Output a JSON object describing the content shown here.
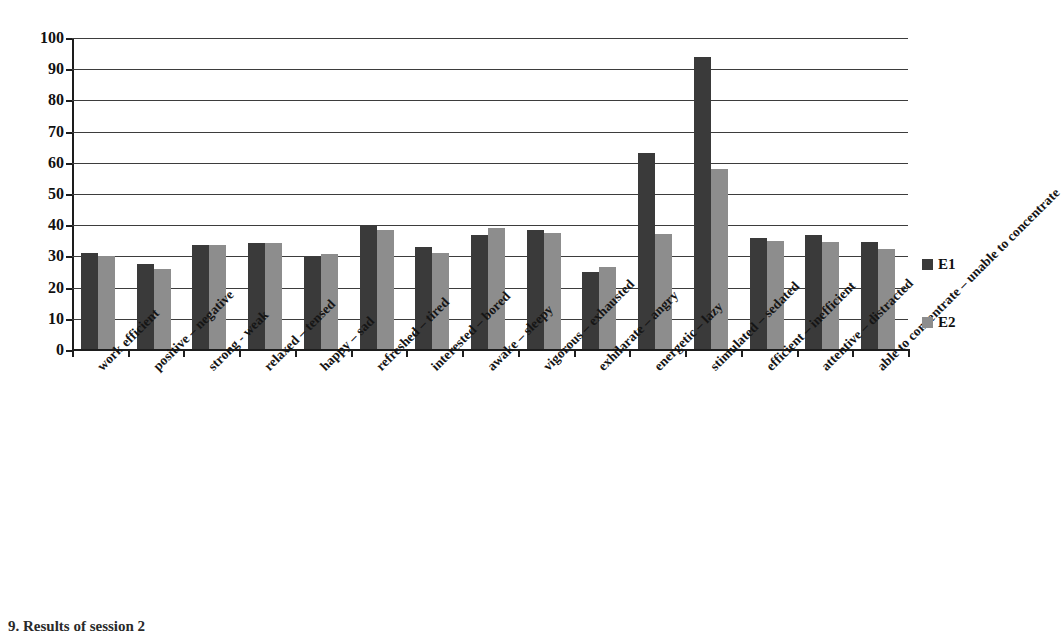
{
  "chart_data": {
    "type": "bar",
    "title": "",
    "subtitle": "",
    "xlabel": "",
    "ylabel": "",
    "ylim": [
      0,
      100
    ],
    "ytick_step": 10,
    "yticks": [
      0,
      10,
      20,
      30,
      40,
      50,
      60,
      70,
      80,
      90,
      100
    ],
    "ytick_labels": [
      "0",
      "10",
      "20",
      "30",
      "40",
      "50",
      "60",
      "70",
      "80",
      "90",
      "100"
    ],
    "grid": true,
    "grid_axis": "y",
    "legend_position": "right",
    "categories": [
      "work efficient",
      "positive – negative",
      "strong - weak",
      "relaxed – tensed",
      "happy – sad",
      "refreshed – tired",
      "interested – bored",
      "awake – sleepy",
      "vigorous – exhausted",
      "exhilarate – angry",
      "energetic – lazy",
      "stimulated – sedated",
      "efficient – inefficient",
      "attentive – distracted",
      "able to concentrate – unable to concentrate"
    ],
    "series": [
      {
        "name": "E1",
        "color": "#3a3a3a",
        "values": [
          31,
          27.5,
          33.8,
          34.3,
          29.8,
          40,
          33,
          37,
          38.5,
          25,
          63,
          94,
          36,
          37,
          34.5
        ]
      },
      {
        "name": "E2",
        "color": "#8d8d8d",
        "values": [
          30.2,
          26,
          33.6,
          34.4,
          30.8,
          38.5,
          31.2,
          39,
          37.5,
          26.5,
          37.2,
          58,
          35,
          34.5,
          32.5
        ]
      }
    ]
  },
  "legend": {
    "items": [
      {
        "label": "E1",
        "color": "#3a3a3a"
      },
      {
        "label": "E2",
        "color": "#8d8d8d"
      }
    ]
  },
  "caption": {
    "text": "9.   Results of session 2"
  }
}
